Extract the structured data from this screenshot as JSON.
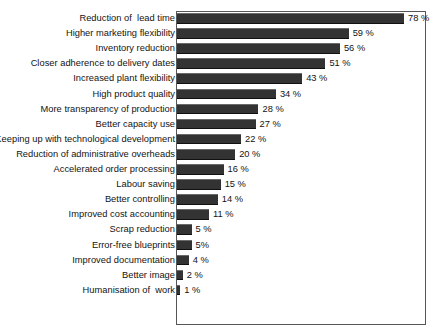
{
  "chart": {
    "type": "bar",
    "orientation": "horizontal",
    "frame_border_color": "#565656",
    "bar_color": "#333333",
    "background": "#ffffff"
  },
  "chart_data": {
    "type": "bar",
    "title": "",
    "xlabel": "",
    "ylabel": "",
    "xlim": [
      0,
      100
    ],
    "grid": false,
    "legend": null,
    "value_suffix": "%",
    "categories": [
      "Reduction of  lead time",
      "Higher marketing flexibility",
      "Inventory reduction",
      "Closer adherence to delivery dates",
      "Increased plant flexibility",
      "High product quality",
      "More transparency of production",
      "Better capacity use",
      "Keeping up with technological development",
      "Reduction of administrative overheads",
      "Accelerated order processing",
      "Labour saving",
      "Better controlling",
      "Improved cost accounting",
      "Scrap reduction",
      "Error-free blueprints",
      "Improved documentation",
      "Better image",
      "Humanisation of  work"
    ],
    "values": [
      78,
      59,
      56,
      51,
      43,
      34,
      28,
      27,
      22,
      20,
      16,
      15,
      14,
      11,
      5,
      5,
      4,
      2,
      1
    ],
    "value_labels": [
      "78 %",
      "59 %",
      "56 %",
      "51 %",
      "43 %",
      "34 %",
      "28 %",
      "27 %",
      "22 %",
      "20 %",
      "16 %",
      "15 %",
      "14 %",
      "11 %",
      "5 %",
      "5%",
      "4 %",
      "2 %",
      "1 %"
    ]
  }
}
